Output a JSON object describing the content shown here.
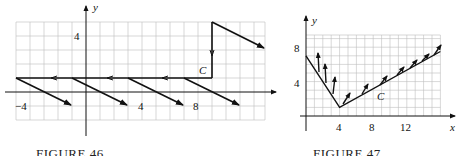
{
  "figures": [
    {
      "caption": "FIGURE 46",
      "axis_labels": {
        "x": "",
        "y": "y"
      },
      "tick_labels": {
        "x": [
          "−4",
          "4",
          "8"
        ],
        "y": [
          "4"
        ]
      },
      "curve_label": "C",
      "description": "Curve C: horizontal line at y=1 from x=-5 to x=9 traversed leftward, then vertical segment at x=9 from y=5 down to y=1; vector field arrows of direction (4,-2)",
      "curve_path": [
        [
          9,
          5
        ],
        [
          9,
          1
        ],
        [
          -5,
          1
        ]
      ],
      "vectors": [
        {
          "from": [
            -5,
            1
          ],
          "to": [
            -1,
            -1
          ]
        },
        {
          "from": [
            -1,
            1
          ],
          "to": [
            3,
            -1
          ]
        },
        {
          "from": [
            3,
            1
          ],
          "to": [
            7,
            -1
          ]
        },
        {
          "from": [
            7,
            1
          ],
          "to": [
            11,
            -1
          ]
        },
        {
          "from": [
            9,
            5
          ],
          "to": [
            13,
            3
          ]
        }
      ]
    },
    {
      "caption": "FIGURE 47",
      "axis_labels": {
        "x": "x",
        "y": "y"
      },
      "tick_labels": {
        "x": [
          "4",
          "8",
          "12"
        ],
        "y": [
          "4",
          "8"
        ]
      },
      "curve_label": "C",
      "description": "Curve C: V shape from (0,7) down to (4,1) then up to (16,7.5); small upward vector arrows along the curve",
      "curve_path": [
        [
          0,
          7
        ],
        [
          4,
          1
        ],
        [
          16,
          7.5
        ]
      ]
    }
  ]
}
